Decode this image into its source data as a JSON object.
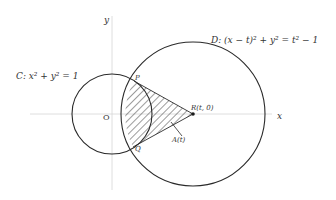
{
  "diagram": {
    "type": "geometry",
    "colors": {
      "curve": "#2a2a2a",
      "axis": "#cfcfcf",
      "hatch": "#3a3a3a",
      "text": "#333333",
      "background": "#ffffff"
    },
    "axes": {
      "x_label": "x",
      "y_label": "y",
      "origin_label": "O"
    },
    "circle_c": {
      "label": "C: x² + y² = 1",
      "center_label": "O"
    },
    "circle_d": {
      "label": "D: (x − t)² + y² = t² − 1",
      "center_label": "R(t, 0)"
    },
    "points": {
      "p_label": "P",
      "q_label": "Q",
      "r_label": "R(t, 0)"
    },
    "region": {
      "label": "A(t)",
      "description": "hatched region bounded by chords RP, RQ and the arc of circle C between P and Q (inside circle D)"
    }
  }
}
